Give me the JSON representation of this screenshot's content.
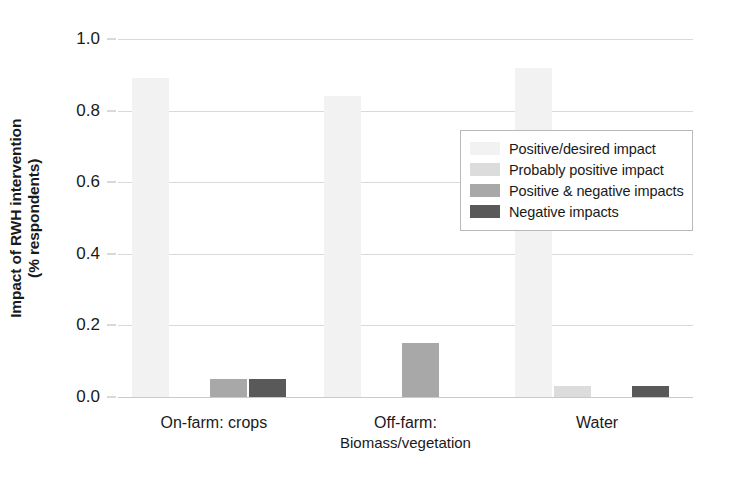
{
  "chart_data": {
    "type": "bar",
    "title": "",
    "xlabel": "",
    "ylabel": "Impact of RWH intervention (% respondents)",
    "ylabel_line1": "Impact of RWH intervention",
    "ylabel_line2": "(% respondents)",
    "ylim": [
      0.0,
      1.0
    ],
    "yticks": [
      "0.0",
      "0.2",
      "0.4",
      "0.6",
      "0.8",
      "1.0"
    ],
    "ytick_values": [
      0.0,
      0.2,
      0.4,
      0.6,
      0.8,
      1.0
    ],
    "grid": true,
    "legend_position": "center-right",
    "categories": [
      "On-farm: crops",
      "Off-farm: Biomass/vegetation",
      "Water"
    ],
    "category_labels": [
      {
        "line1": "On-farm: crops",
        "line2": ""
      },
      {
        "line1": "Off-farm:",
        "line2": "Biomass/vegetation"
      },
      {
        "line1": "Water",
        "line2": ""
      }
    ],
    "series": [
      {
        "name": "Positive/desired impact",
        "color": "#f2f2f2",
        "values": [
          0.89,
          0.84,
          0.92
        ]
      },
      {
        "name": "Probably positive impact",
        "color": "#dcdcdc",
        "values": [
          0.0,
          0.0,
          0.03
        ]
      },
      {
        "name": "Positive & negative impacts",
        "color": "#a8a8a8",
        "values": [
          0.05,
          0.15,
          0.0
        ]
      },
      {
        "name": "Negative impacts",
        "color": "#595959",
        "values": [
          0.05,
          0.0,
          0.03
        ]
      }
    ]
  },
  "legend": {
    "items": [
      {
        "label": "Positive/desired impact",
        "color": "#f2f2f2"
      },
      {
        "label": "Probably positive impact",
        "color": "#dcdcdc"
      },
      {
        "label": "Positive & negative impacts",
        "color": "#a8a8a8"
      },
      {
        "label": "Negative impacts",
        "color": "#595959"
      }
    ]
  },
  "colors": {
    "gridline": "#d9d9d9",
    "axis_text": "#1a1a1a",
    "background": "#ffffff",
    "legend_border": "#b9b9b9"
  }
}
